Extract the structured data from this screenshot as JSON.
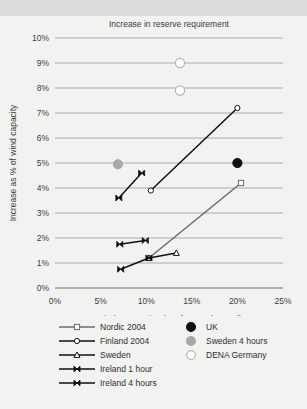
{
  "chart_data": {
    "type": "line",
    "title": "Increase in reserve requirement",
    "xlabel": "Wind penetration (% of gross demand)",
    "ylabel": "Increase as % of wind capacity",
    "xlim": [
      0,
      25
    ],
    "ylim": [
      0,
      10
    ],
    "xticks": [
      "0%",
      "5%",
      "10%",
      "15%",
      "20%",
      "25%"
    ],
    "xtick_values": [
      0,
      5,
      10,
      15,
      20,
      25
    ],
    "yticks": [
      "0%",
      "1%",
      "2%",
      "3%",
      "4%",
      "5%",
      "6%",
      "7%",
      "8%",
      "9%",
      "10%"
    ],
    "ytick_values": [
      0,
      1,
      2,
      3,
      4,
      5,
      6,
      7,
      8,
      9,
      10
    ],
    "grid": "horizontal",
    "legend_position": "below",
    "series": [
      {
        "name": "Nordic 2004",
        "marker": "open-square",
        "color": "#6b6b6b",
        "points": [
          [
            10.3,
            1.2
          ],
          [
            20.4,
            4.2
          ]
        ]
      },
      {
        "name": "Finland 2004",
        "marker": "open-circle",
        "color": "#111111",
        "points": [
          [
            10.5,
            3.9
          ],
          [
            20.0,
            7.2
          ]
        ]
      },
      {
        "name": "Sweden",
        "marker": "open-triangle",
        "color": "#111111",
        "points": [
          [
            10.3,
            1.2
          ],
          [
            13.3,
            1.4
          ]
        ]
      },
      {
        "name": "Ireland 1 hour",
        "marker": "bowtie",
        "color": "#111111",
        "points": [
          [
            7.1,
            1.75
          ],
          [
            9.9,
            1.9
          ]
        ]
      },
      {
        "name": "Ireland 4 hours",
        "marker": "bowtie",
        "color": "#111111",
        "points": [
          [
            7.0,
            3.6
          ],
          [
            9.5,
            4.6
          ]
        ]
      },
      {
        "name": "Ireland 4 hours (low)",
        "marker": "bowtie",
        "color": "#111111",
        "points": [
          [
            7.2,
            0.75
          ],
          [
            10.3,
            1.2
          ]
        ]
      }
    ],
    "scatter": [
      {
        "name": "UK",
        "marker": "filled-circle",
        "color": "#111111",
        "points": [
          [
            20.0,
            5.0
          ]
        ]
      },
      {
        "name": "Sweden 4 hours",
        "marker": "filled-circle",
        "color": "#a8a8a8",
        "points": [
          [
            6.9,
            4.95
          ]
        ]
      },
      {
        "name": "DENA Germany",
        "marker": "open-circle",
        "color": "#ffffff",
        "points": [
          [
            13.7,
            9.0
          ],
          [
            13.7,
            7.9
          ]
        ]
      }
    ]
  },
  "legend": {
    "lines": [
      {
        "label": "Nordic 2004",
        "marker": "open-square",
        "color": "#6b6b6b"
      },
      {
        "label": "Finland 2004",
        "marker": "open-circle",
        "color": "#111111"
      },
      {
        "label": "Sweden",
        "marker": "open-triangle",
        "color": "#111111"
      },
      {
        "label": "Ireland 1 hour",
        "marker": "bowtie",
        "color": "#111111"
      },
      {
        "label": "Ireland 4 hours",
        "marker": "bowtie",
        "color": "#111111"
      }
    ],
    "points": [
      {
        "label": "UK",
        "marker": "filled-circle",
        "color": "#111111"
      },
      {
        "label": "Sweden 4 hours",
        "marker": "filled-circle",
        "color": "#a8a8a8"
      },
      {
        "label": "DENA Germany",
        "marker": "open-circle",
        "color": "#ffffff"
      }
    ]
  },
  "colors": {
    "banner": "#dcdcdc",
    "background": "#f2f2f1",
    "grid": "#9a9a9a",
    "text": "#3c3c3c"
  }
}
